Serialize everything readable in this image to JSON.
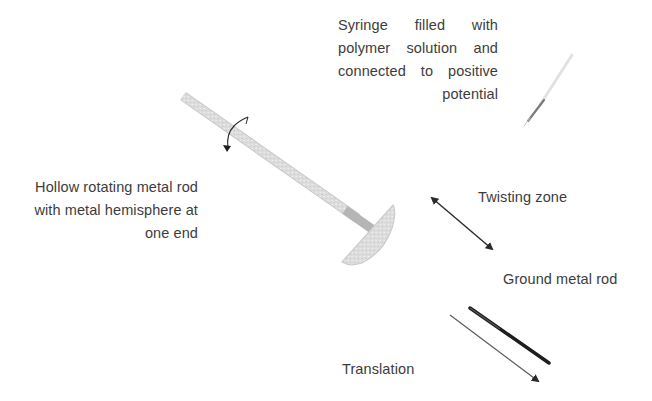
{
  "diagram": {
    "labels": {
      "syringe": {
        "lines": [
          "Syringe filled with",
          "polymer solution and",
          "connected to positive",
          "potential"
        ]
      },
      "rotating_rod": {
        "lines": [
          "Hollow rotating metal rod",
          "with metal hemisphere at",
          "one end"
        ]
      },
      "twisting_zone": "Twisting zone",
      "ground_rod": "Ground metal rod",
      "translation": "Translation"
    },
    "components": [
      {
        "name": "syringe",
        "description": "Syringe needle pointing down-left, upper right"
      },
      {
        "name": "hollow-rotating-rod",
        "description": "Diagonal grey rod with rotation arrow"
      },
      {
        "name": "metal-hemisphere",
        "description": "Hemisphere at lower end of rod"
      },
      {
        "name": "twisting-zone-arrow",
        "description": "Double-headed diagonal arrow"
      },
      {
        "name": "ground-metal-rod",
        "description": "Dark diagonal rod, lower right"
      },
      {
        "name": "translation-arrow",
        "description": "Thin diagonal arrow parallel to ground rod"
      }
    ],
    "colors": {
      "text": "#3c3c3c",
      "rod": "#d4d4d4",
      "rod_edge": "#bdbdbd",
      "ground_rod": "#1e1e1e",
      "arrow": "#2a2a2a"
    }
  }
}
